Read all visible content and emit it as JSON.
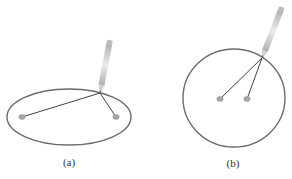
{
  "figure": {
    "panels": [
      {
        "id": "a",
        "label": "(a)",
        "shape": "ellipse",
        "center": [
          69,
          117
        ],
        "rx": 62,
        "ry": 28,
        "pins": [
          [
            22,
            117
          ],
          [
            116,
            117
          ]
        ],
        "pencil_tip": [
          100,
          93
        ],
        "pencil_top": [
          110,
          40
        ],
        "label_pos": [
          69,
          156
        ]
      },
      {
        "id": "b",
        "label": "(b)",
        "shape": "circle",
        "center": [
          234,
          98
        ],
        "rx": 51,
        "ry": 49,
        "pins": [
          [
            220,
            99
          ],
          [
            247,
            99
          ]
        ],
        "pencil_tip": [
          262,
          58
        ],
        "pencil_top": [
          282,
          7
        ],
        "label_pos": [
          233,
          157
        ]
      }
    ]
  },
  "colors": {
    "outline": "#6b6b6b",
    "string": "#2a2a2a",
    "pin": "#a8a8a8",
    "pencil_body": "#d4d4d4",
    "pencil_shade": "#b0b0b0",
    "text": "#333333"
  }
}
